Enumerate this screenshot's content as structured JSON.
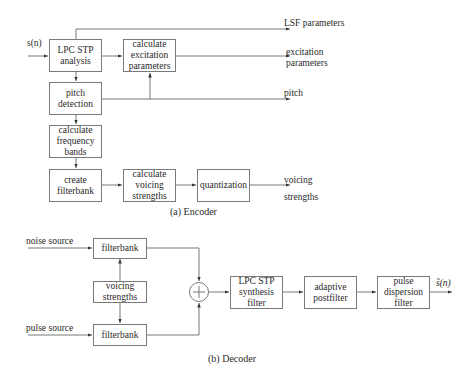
{
  "encoder": {
    "input_label": "s(n)",
    "boxes": {
      "lpc_analysis": "LPC STP\nanalysis",
      "excitation": "calculate\nexcitation\nparameters",
      "pitch": "pitch\ndetection",
      "freq_bands": "calculate\nfrequency\nbands",
      "create_filterbank": "create\nfilterbank",
      "voicing": "calculate\nvoicing\nstrengths",
      "quantization": "quantization"
    },
    "outputs": {
      "lsf": "LSF parameters",
      "excitation": "excitation\nparameters",
      "pitch": "pitch",
      "voicing": "voicing\nstrengths"
    },
    "caption": "(a) Encoder"
  },
  "decoder": {
    "inputs": {
      "noise": "noise source",
      "pulse": "pulse source"
    },
    "boxes": {
      "filterbank_noise": "filterbank",
      "voicing": "voicing\nstrengths",
      "filterbank_pulse": "filterbank",
      "lpc_synthesis": "LPC STP\nsynthesis\nfilter",
      "postfilter": "adaptive\npostfilter",
      "dispersion": "pulse\ndispersion\nfilter"
    },
    "sum_symbol": "+",
    "output_label": "s̃(n)",
    "caption": "(b) Decoder"
  }
}
